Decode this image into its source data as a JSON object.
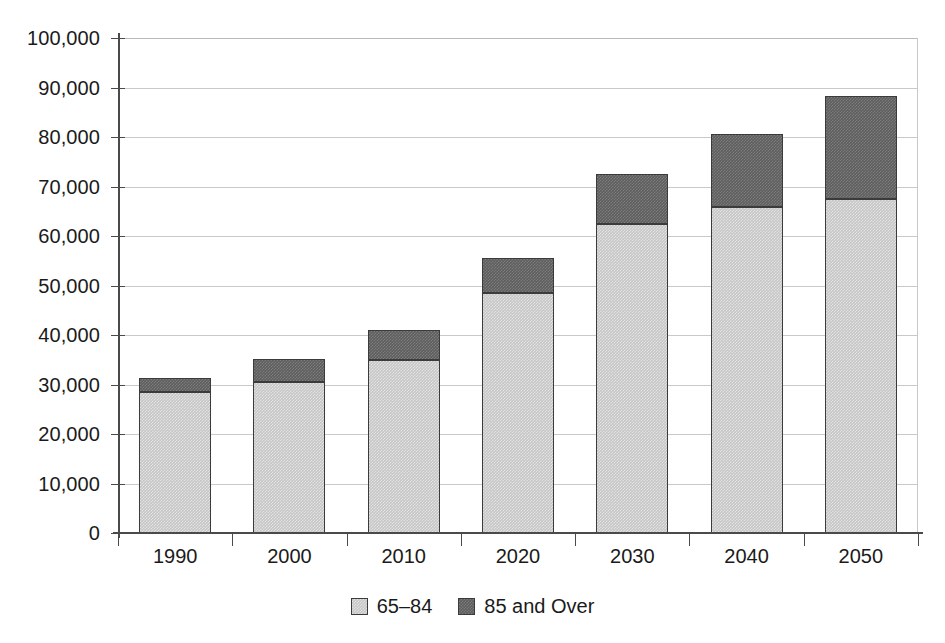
{
  "chart_data": {
    "type": "bar",
    "stacked": true,
    "title": "",
    "subtitle": "",
    "xlabel": "",
    "ylabel": "",
    "categories": [
      "1990",
      "2000",
      "2010",
      "2020",
      "2030",
      "2040",
      "2050"
    ],
    "series": [
      {
        "name": "65–84",
        "color": "#c6c6c6",
        "values": [
          28500,
          30500,
          35000,
          48500,
          62500,
          65800,
          67400
        ]
      },
      {
        "name": "85 and Over",
        "color": "#5e5e5e",
        "values": [
          2800,
          4600,
          6000,
          7000,
          10100,
          14900,
          20800
        ]
      }
    ],
    "totals": [
      31300,
      35100,
      41000,
      55500,
      72600,
      80700,
      88200
    ],
    "ylim": [
      0,
      100000
    ],
    "ytick_step": 10000,
    "yticks": [
      0,
      10000,
      20000,
      30000,
      40000,
      50000,
      60000,
      70000,
      80000,
      90000,
      100000
    ],
    "ytick_labels": [
      "0",
      "10,000",
      "20,000",
      "30,000",
      "40,000",
      "50,000",
      "60,000",
      "70,000",
      "80,000",
      "90,000",
      "100,000"
    ],
    "grid": true,
    "grid_axis": "y",
    "legend_position": "bottom",
    "legend_entries": [
      "65–84",
      "85 and Over"
    ],
    "colors": {
      "series_low": "#c6c6c6",
      "series_high": "#5e5e5e",
      "gridline": "#c9c9c9",
      "axis": "#4a4a4a",
      "text": "#1a1a1a",
      "bar_outline": "#3b3b3b",
      "background": "#ffffff"
    }
  }
}
